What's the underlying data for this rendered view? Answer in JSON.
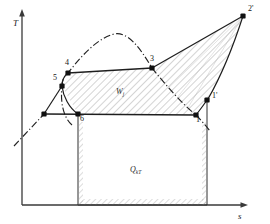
{
  "figure": {
    "kind": "thermodynamic-ts-diagram",
    "background_color": "#ffffff",
    "line_color": "#1a1a1a",
    "hatch_color": "#8c8c8c"
  },
  "axes": {
    "y_label": "T",
    "x_label": "s",
    "origin": {
      "x": 22,
      "y": 205
    },
    "y_top": {
      "x": 22,
      "y": 12
    },
    "x_right": {
      "x": 248,
      "y": 205
    }
  },
  "points": [
    {
      "id": "p2prime",
      "label": "2'",
      "x": 243,
      "y": 16,
      "label_dx": 5,
      "label_dy": -2
    },
    {
      "id": "p3",
      "label": "3",
      "x": 152,
      "y": 68,
      "label_dx": -2,
      "label_dy": -4
    },
    {
      "id": "p4",
      "label": "4",
      "x": 68,
      "y": 73,
      "label_dx": -3,
      "label_dy": -5
    },
    {
      "id": "p5",
      "label": "5",
      "x": 62,
      "y": 86,
      "label_dx": -9,
      "label_dy": -3
    },
    {
      "id": "p1prime",
      "label": "1'",
      "x": 207,
      "y": 100,
      "label_dx": 5,
      "label_dy": 1
    },
    {
      "id": "p1",
      "label": "1",
      "x": 196,
      "y": 115,
      "label_dx": 0,
      "label_dy": 10
    },
    {
      "id": "p6",
      "label": "6",
      "x": 78,
      "y": 114,
      "label_dx": 2,
      "label_dy": 10
    },
    {
      "id": "pleft",
      "label": "",
      "x": 44,
      "y": 114,
      "label_dx": 0,
      "label_dy": 0
    }
  ],
  "areas": [
    {
      "id": "work-area",
      "label": "W",
      "sub": "j",
      "label_x": 116,
      "label_y": 94
    },
    {
      "id": "heat-area",
      "label": "Q",
      "sub": "kT",
      "label_x": 132,
      "label_y": 170
    }
  ],
  "curves": {
    "saturation_dome": "dash-dot curve through 5, 4, apex, 3, down to 1",
    "cycle_upper": "3 to 2' straight, 2' to 1' curved",
    "isotherm_upper": "4 to 3 horizontal",
    "isotherm_lower": "left point to 6 to 1 horizontal"
  }
}
